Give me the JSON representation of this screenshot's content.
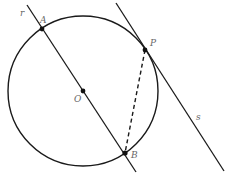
{
  "diagram": {
    "circle": {
      "center_label": "O",
      "cx": 83,
      "cy": 91,
      "r": 75
    },
    "points": [
      {
        "id": "A",
        "label": "A",
        "x": 42,
        "y": 29,
        "lx": 40,
        "ly": 23
      },
      {
        "id": "O",
        "label": "O",
        "x": 83,
        "y": 91,
        "lx": 74,
        "ly": 102
      },
      {
        "id": "B",
        "label": "B",
        "x": 125,
        "y": 153,
        "lx": 131,
        "ly": 158
      },
      {
        "id": "P",
        "label": "P",
        "x": 145,
        "y": 50,
        "lx": 150,
        "ly": 46
      }
    ],
    "lines": [
      {
        "id": "r",
        "label": "r",
        "x1": 27,
        "y1": 5,
        "x2": 136,
        "y2": 172,
        "lx": 20,
        "ly": 16
      },
      {
        "id": "s",
        "label": "s",
        "x1": 116,
        "y1": 3,
        "x2": 224,
        "y2": 171,
        "lx": 196,
        "ly": 120
      }
    ],
    "segments": [
      {
        "id": "PB",
        "from": "P",
        "to": "B",
        "style": "dashed"
      }
    ],
    "colors": {
      "stroke": "#1a1a1a",
      "label": "#666666"
    }
  }
}
